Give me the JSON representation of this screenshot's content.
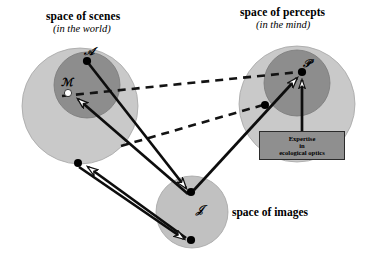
{
  "figure": {
    "kind": "diagram",
    "background": "#ffffff",
    "colors": {
      "outer_circle": "#c9c9c9",
      "inner_circle": "#8d8d8d",
      "image_circle": "#c1c1c1",
      "stroke": "#1a1a1a",
      "box_fill": "#8f8f8f",
      "point_fill": "#000000",
      "hollow_point_fill": "#ffffff",
      "arrowhead_fill": "#ffffff"
    }
  },
  "titles": {
    "scenes_main": "space of scenes",
    "scenes_sub": "(in the world)",
    "percepts_main": "space of percepts",
    "percepts_sub": "(in the mind)",
    "images_main": "space of images"
  },
  "point_labels": {
    "scene_A": "ℬ",
    "scene_A_display": "𝒜",
    "scene_M": "ℳ",
    "percept_P": "𝒫",
    "image_I": "𝒥"
  },
  "annotation_box": {
    "line1": "Expertise",
    "line2": "in",
    "line3": "ecological optics"
  },
  "regions": [
    {
      "name": "space-of-scenes",
      "cx": 80,
      "cy": 106,
      "r": 58,
      "shade": "outer"
    },
    {
      "name": "scenes-inner",
      "cx": 87,
      "cy": 85,
      "r": 33,
      "shade": "inner"
    },
    {
      "name": "space-of-percepts",
      "cx": 297,
      "cy": 104,
      "r": 58,
      "shade": "outer"
    },
    {
      "name": "percepts-inner",
      "cx": 297,
      "cy": 83,
      "r": 33,
      "shade": "inner"
    },
    {
      "name": "space-of-images",
      "cx": 192,
      "cy": 212,
      "r": 36,
      "shade": "outer"
    }
  ],
  "points": [
    {
      "name": "point-A",
      "x": 87,
      "y": 61,
      "filled": true,
      "label": "𝒜"
    },
    {
      "name": "point-M",
      "x": 68,
      "y": 93,
      "filled": false,
      "label": "ℳ"
    },
    {
      "name": "point-scene-lower",
      "x": 78,
      "y": 163,
      "filled": true,
      "label": ""
    },
    {
      "name": "point-P",
      "x": 302,
      "y": 72,
      "filled": true,
      "label": "𝒫"
    },
    {
      "name": "point-percept-mid",
      "x": 265,
      "y": 105,
      "filled": true,
      "label": ""
    },
    {
      "name": "point-image-upper",
      "x": 191,
      "y": 192,
      "filled": true,
      "label": "𝒥"
    },
    {
      "name": "point-image-lower",
      "x": 191,
      "y": 240,
      "filled": true,
      "label": ""
    }
  ],
  "solid_arrows": [
    {
      "name": "arrow-A-to-image-upper",
      "x1": 87,
      "y1": 61,
      "x2": 189,
      "y2": 191
    },
    {
      "name": "arrow-image-upper-to-M",
      "x1": 189,
      "y1": 193,
      "x2": 72,
      "y2": 95
    },
    {
      "name": "arrow-image-lower-to-scene-lower",
      "x1": 188,
      "y1": 239,
      "x2": 82,
      "y2": 162
    },
    {
      "name": "arrow-scene-lower-to-image-lower",
      "x1": 80,
      "y1": 166,
      "x2": 188,
      "y2": 242
    },
    {
      "name": "arrow-image-upper-to-P",
      "x1": 194,
      "y1": 191,
      "x2": 300,
      "y2": 75
    },
    {
      "name": "arrow-box-to-P",
      "x1": 302,
      "y1": 131,
      "x2": 302,
      "y2": 77
    }
  ],
  "dashed_lines": [
    {
      "name": "dashed-A-to-P",
      "x1": 62,
      "y1": 96,
      "x2": 299,
      "y2": 72
    },
    {
      "name": "dashed-lower-to-percept-mid",
      "x1": 121,
      "y1": 146,
      "x2": 263,
      "y2": 105
    }
  ],
  "box": {
    "name": "expertise-box",
    "x": 259,
    "y": 131,
    "w": 86,
    "h": 29
  }
}
